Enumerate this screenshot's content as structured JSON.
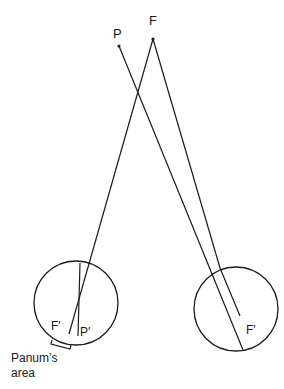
{
  "diagram": {
    "points": {
      "P": {
        "label": "P",
        "x": 119,
        "y": 46
      },
      "F": {
        "label": "F",
        "x": 153,
        "y": 39
      }
    },
    "left_eye": {
      "center": [
        76,
        303
      ],
      "radius": 42,
      "labels": {
        "F_prime": "F′",
        "P_prime": "P′"
      }
    },
    "right_eye": {
      "center": [
        236,
        308
      ],
      "radius": 42,
      "labels": {
        "F_prime": "F′"
      }
    },
    "annotation": {
      "line1": "Panum’s",
      "line2": "area"
    },
    "stroke_color": "#1a1a1a"
  }
}
